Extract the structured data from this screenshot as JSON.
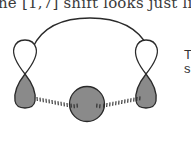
{
  "text": {
    "top_line": "he [1,7] shift looks just like the",
    "side_line_1": "T",
    "side_line_2": "s"
  },
  "diagram": {
    "elements": [
      {
        "type": "arc",
        "label": "polyene-chain"
      },
      {
        "type": "p-orbital",
        "position": "left",
        "upper_lobe": "white",
        "lower_lobe": "gray"
      },
      {
        "type": "p-orbital",
        "position": "right",
        "upper_lobe": "white",
        "lower_lobe": "gray"
      },
      {
        "type": "s-orbital",
        "position": "center",
        "fill": "gray"
      },
      {
        "type": "partial-bond",
        "from": "left-lower-lobe",
        "to": "center-sphere"
      },
      {
        "type": "partial-bond",
        "from": "center-sphere",
        "to": "right-lower-lobe"
      }
    ],
    "colors": {
      "shaded_lobe": "#8a8a8a",
      "outline": "#2a2a2a",
      "white_lobe": "#ffffff"
    }
  }
}
